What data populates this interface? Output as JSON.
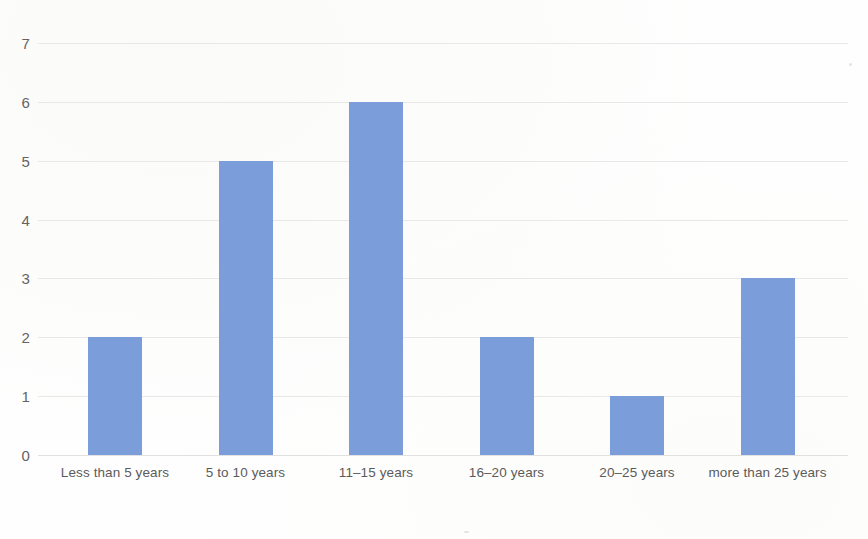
{
  "chart_data": {
    "type": "bar",
    "title": "",
    "subtitle": "",
    "xlabel": "",
    "ylabel": "",
    "categories": [
      "Less than 5 years",
      "5 to 10 years",
      "11–15 years",
      "16–20 years",
      "20–25 years",
      "more than 25 years"
    ],
    "values": [
      2,
      5,
      6,
      2,
      1,
      3
    ],
    "ylim": [
      0,
      7
    ],
    "yticks": [
      0,
      1,
      2,
      3,
      4,
      5,
      6,
      7
    ],
    "ytick_labels": [
      "0",
      "1",
      "2",
      "3",
      "4",
      "5",
      "6",
      "7"
    ],
    "grid": true,
    "grid_axis": "y",
    "legend": false,
    "legend_position": "none",
    "bar_color": "#7b9edb",
    "gridline_color": "#e4e4e4",
    "tick_label_color": "#5b5b5b",
    "background_color": "#fefefe",
    "series": [
      {
        "name": "Responses",
        "values": [
          2,
          5,
          6,
          2,
          1,
          3
        ]
      }
    ]
  }
}
